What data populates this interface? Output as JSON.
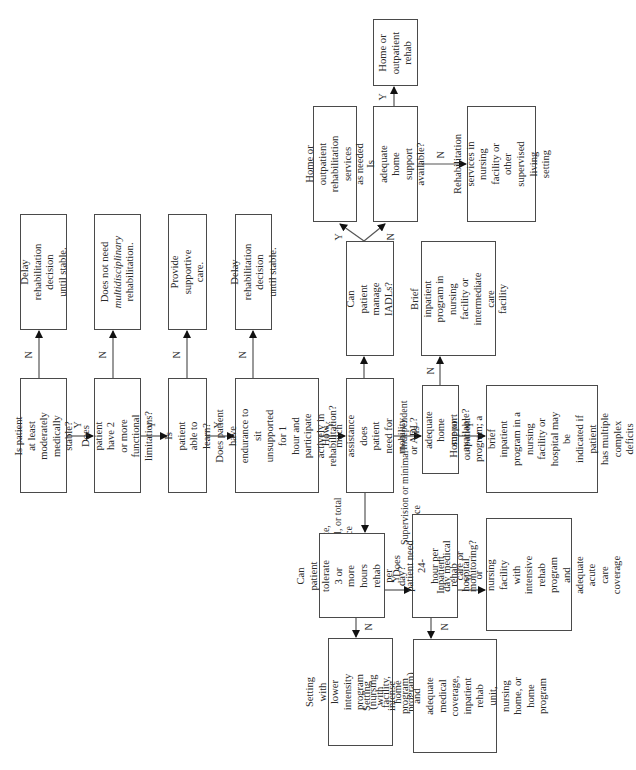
{
  "diagram": {
    "type": "flowchart",
    "orientation": "rotated-90-ccw",
    "nodes": {
      "q_stable": "Is patient at least\nmoderately medically\nstable?",
      "o_delay1": "Delay rehabilitation\ndecision until stable.",
      "q_limitations": "Does patient have 2\nor more functional\nlimitations?",
      "o_not_multi_pre": "Does not need",
      "o_not_multi_em": "multidisciplinary",
      "o_not_multi_post": "rehabilitation.",
      "q_learn": "Is patient able to\nlearn?",
      "o_supportive": "Provide supportive\ncare.",
      "q_endurance": "Does patient have\nendurance to sit\nunsupported for 1\nhour and participate\nactively in\nrehabilitation?",
      "o_delay2": "Delay rehabilitation\ndecision until stable.",
      "q_assistance": "How much assistance\ndoes patient need for\nmobility or ADL?",
      "q_iadls": "Can patient manage\nIADLs?",
      "o_home_services": "Home or outpatient\nrehabilitation services\nas needed",
      "q_home_support_1": "Is adequate home\nsupport available?",
      "o_home_rehab": "Home or\noutpatient\nrehab",
      "o_rehab_nursing": "Rehabilitation\nservices in nursing\nfacility or other\nsupervised living\nsetting",
      "o_brief_inpatient": "Brief inpatient\nprogram in nursing\nfacility or\nintermediate care\nfacility",
      "q_home_support_2": "Is adequate home\nsupport available?",
      "o_home_program": "Home or outpatient\nprogram; a brief\ninpatient program in a\nnursing facility or\nhospital may be\nindicated if patient\nhas multiple complex\ndeficits",
      "q_tolerate": "Can patient\ntolerate 3 or\nmore hours rehab\nper day?",
      "o_lower_intensity": "Setting with lower\nintensity program\n(nursing facility,\nhome program)",
      "q_24hour": "Does patient need 24-\nhour per day medical\ncare or monitoring?",
      "o_intense_program": "Setting with intense\nprogram and adequate\nmedical coverage,\ninpatient rehab unit,\nnursing home, or\nhome program",
      "o_inpatient_rehab": "Inpatient rehab\nhospital or nursing\nfacility with intensive\nrehab program and\nadequate acute care\ncoverage"
    },
    "branch_labels": {
      "yes": "Y",
      "no": "N",
      "independent": "Independent",
      "moderate": "Moderate,\nmaximal, or total\nassistance",
      "supervision": "Supervision or minimal\nassistance"
    }
  }
}
